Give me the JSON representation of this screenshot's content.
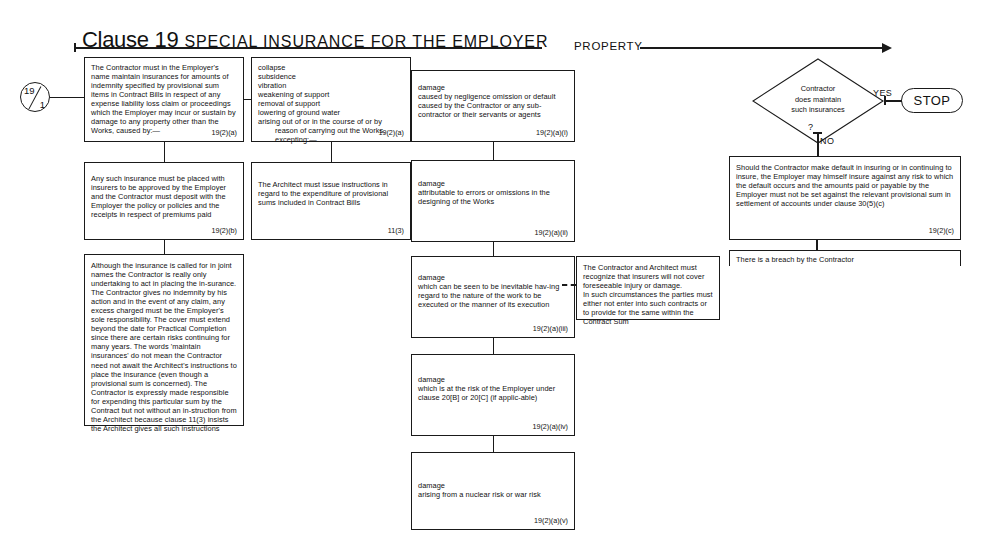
{
  "header": {
    "clause": "Clause 19",
    "subtitle": "SPECIAL INSURANCE FOR THE EMPLOYER"
  },
  "entry_node": {
    "top": "19",
    "bottom": "1"
  },
  "spine_label": "PROPERTY",
  "boxes": {
    "b1": {
      "text": "The Contractor must in the Employer's name maintain insurances for amounts of indemnity specified by provisional sum items in Contract Bills in respect of any expense liability loss claim or proceedings which the Employer may incur or sustain by damage to any property other than the Works, caused by:—",
      "ref": "19(2)(a)"
    },
    "b2": {
      "text": "collapse\nsubsidence\nvibration\nweakening of support\nremoval of support\nlowering of ground water\narising out of or in the course of or by",
      "indent1": "reason of carrying out the Works,",
      "indent2": "excepting:—",
      "ref": "19(2)(a)"
    },
    "b3": {
      "text": "damage\ncaused by negligence omission or default caused by the Contractor or any sub-contractor or their servants or agents",
      "ref": "19(2)(a)(i)"
    },
    "b4": {
      "text": "Any such insurance must be placed with insurers to be approved by the Employer and the Contractor must deposit with the Employer the policy or policies and the receipts in respect of premiums paid",
      "ref": "19(2)(b)"
    },
    "b5": {
      "text": "The Architect must issue instructions in regard to the expenditure of provisional sums included in Contract Bills",
      "ref": "11(3)"
    },
    "b6": {
      "text": "damage\nattributable to errors or omissions in the designing of the Works",
      "ref": "19(2)(a)(ii)"
    },
    "b7": {
      "text": "Although the insurance is called for in joint names the Contractor is really only undertaking to act in placing the in-surance. The Contractor gives no indemnity by his action and in the event of any claim, any excess charged must be the Employer's sole responsibility. The cover must extend beyond the date for Practical Completion since there are certain risks continuing for many years. The words 'maintain insurances' do not mean the Contractor need not await the Architect's instructions to place the insurance (even though a provisional sum is concerned). The Contractor is expressly made responsible for expending this particular sum by the Contract but not without an in-struction from the Architect because clause 11(3) insists the Architect gives all such instructions",
      "ref": ""
    },
    "b8": {
      "text": "damage\nwhich can be seen to be inevitable hav-ing regard to the nature of the work to be executed or the manner of its execution",
      "ref": "19(2)(a)(iii)"
    },
    "b9": {
      "text": "The Contractor and Architect must recognize that insurers will not cover foreseeable injury or damage.\nIn such circumstances the parties must either not enter into such contracts or to provide for the same within the Contract Sum",
      "ref": ""
    },
    "b10": {
      "text": "damage\nwhich is at the risk of the Employer under clause 20[B] or 20[C]  (if applic-able)",
      "ref": "19(2)(a)(iv)"
    },
    "b11": {
      "text": "damage\narising from a nuclear risk or war risk",
      "ref": "19(2)(a)(v)"
    },
    "b12": {
      "text": "Should the Contractor make default in insuring or in continuing to insure, the Employer may himself insure against any risk to which the default occurs and the amounts paid or payable by the Employer must not be set against the relevant provisional sum in settlement of accounts under clause 30(5)(c)",
      "ref": "19(2)(c)"
    },
    "b13": {
      "text": "There is a breach by the Contractor",
      "ref": ""
    }
  },
  "decision": {
    "line1": "Contractor",
    "line2": "does maintain",
    "line3": "such insurances",
    "question_mark": "?",
    "yes_label": "YES",
    "no_label": "NO"
  },
  "terminator": {
    "label": "STOP"
  }
}
